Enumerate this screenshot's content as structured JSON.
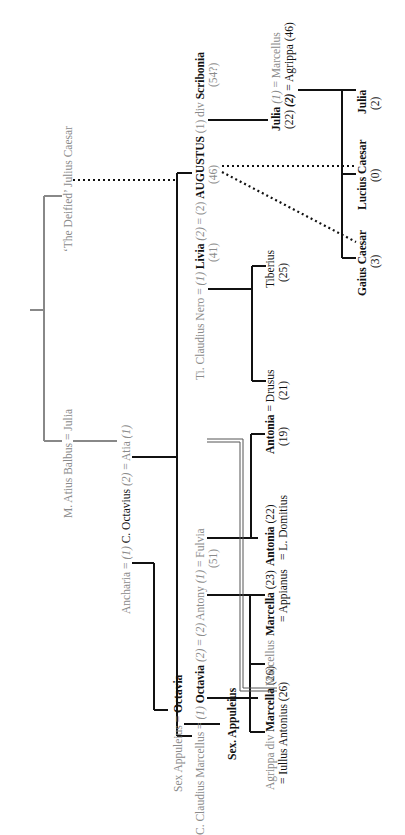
{
  "orientation": "rotated -90deg",
  "people": {
    "caesar": "‘The Deified’ Julius Caesar",
    "balbus_julia": "M. Atius Balbus = Julia",
    "ancharia": "Ancharia",
    "eq1": "=",
    "n1": "(1)",
    "octavius": "C. Octavius",
    "n2": "(2)",
    "eq2": "=",
    "atia": "Atia",
    "n1b": "(1)",
    "sex_app_father": "Sex Appuleius",
    "eq3": "=",
    "octavia_elder": "Octavia",
    "sex_appuleius": "Sex. Appuleius",
    "marcellus_c": "C. Claudius Marcellus",
    "eq4": "=",
    "n1c": "(1)",
    "octavia": "Octavia",
    "octavia_age": "(51)",
    "n2c": "(2)",
    "eq5": "=",
    "n2d": "(2)",
    "antony": "Antony",
    "n1d": "(1)",
    "eq6": "=",
    "fulvia": "Fulvia",
    "nero": "Ti. Claudius Nero",
    "eq7": "=",
    "n1e": "(1)",
    "livia": "Livia",
    "livia_age": "(41)",
    "n2e": "(2)",
    "eq8": "=",
    "n2f": "(2)",
    "augustus": "AUGUSTUS",
    "augustus_age": "(46)",
    "n1f": "(1)",
    "div1": "div",
    "scribonia": "Scribonia",
    "scribonia_age": "(54?)",
    "agrippa": "Agrippa",
    "div2": "div",
    "marcella_elder": "Marcella",
    "marcella_elder_age": "(26)",
    "marcella_elder_spouse": "= Iullus Antonius (26)",
    "marcellus": "Marcellus",
    "marcella_younger": "Marcella",
    "marcella_younger_age": "(23)",
    "marcella_younger_spouse": "= Appianus",
    "antonia_elder": "Antonia",
    "antonia_elder_age": "(22)",
    "antonia_elder_spouse": "= L. Domitius",
    "antonia_younger": "Antonia",
    "eq9": "=",
    "drusus": "Drusus",
    "antonia_younger_age": "(19)",
    "drusus_age": "(21)",
    "tiberius": "Tiberius",
    "tiberius_age": "(25)",
    "julia": "Julia",
    "julia_age": "(22)",
    "julia_n1": "(1)",
    "julia_m1": "= Marcellus",
    "julia_n2": "(2)",
    "julia_m2": "= Agrippa (46)",
    "gaius": "Gaius Caesar",
    "gaius_age": "(3)",
    "lucius": "Lucius Caesar",
    "lucius_age": "(0)",
    "julia_minor": "Julia",
    "julia_minor_age": "(2)"
  },
  "colors": {
    "line": "#111111",
    "grey_line": "#8a8a8a",
    "grey_text": "#8a8a8a"
  }
}
